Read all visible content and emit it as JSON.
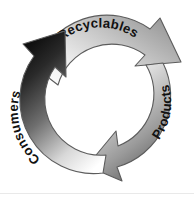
{
  "diagram": {
    "background_color": "#ffffff",
    "width": 194,
    "height": 200,
    "center": {
      "x": 97,
      "y": 100
    },
    "segments": [
      {
        "id": "recyclables",
        "label": "Recyclables",
        "position": "top",
        "direction": "clockwise",
        "arrow_tip": "right",
        "text_color": "#111111",
        "gradient_from": "#ffffff",
        "gradient_to": "#9a9a9a",
        "arrowhead_color": "#9d9d9d",
        "start_angle_deg": 205,
        "end_angle_deg": 330
      },
      {
        "id": "products",
        "label": "Products",
        "position": "right",
        "direction": "clockwise",
        "arrow_tip": "bottom",
        "text_color": "#111111",
        "gradient_from": "#f2f2f2",
        "gradient_to": "#6a6a6a",
        "arrowhead_color": "#4a4a4a",
        "start_angle_deg": 330,
        "end_angle_deg": 90
      },
      {
        "id": "consumers",
        "label": "Consumers",
        "position": "left",
        "direction": "clockwise",
        "arrow_tip": "top",
        "text_color": "#f2f2f2",
        "gradient_from": "#ffffff",
        "gradient_to": "#101010",
        "arrowhead_color": "#161616",
        "start_angle_deg": 90,
        "end_angle_deg": 205
      }
    ],
    "outline_color": "#5c5c5c",
    "baseline_rule_color": "#e9e9e9"
  }
}
